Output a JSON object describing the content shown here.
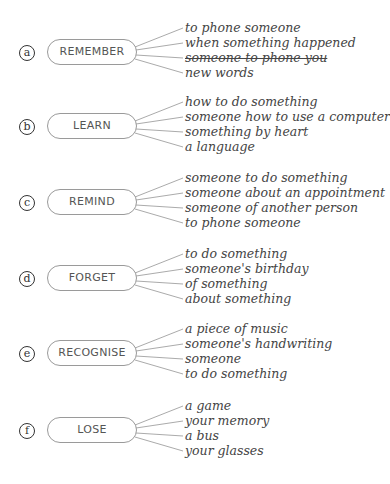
{
  "groups": [
    {
      "letter": "a",
      "verb": "REMEMBER",
      "options": [
        "to phone someone",
        "when something happened",
        "someone to phone you",
        "new words"
      ],
      "struck_index": 2
    },
    {
      "letter": "b",
      "verb": "LEARN",
      "options": [
        "how to do something",
        "someone how to use a computer",
        "something by heart",
        "a language"
      ],
      "struck_index": -1
    },
    {
      "letter": "c",
      "verb": "REMIND",
      "options": [
        "someone to do something",
        "someone about an appointment",
        "someone of another person",
        "to phone someone"
      ],
      "struck_index": -1
    },
    {
      "letter": "d",
      "verb": "FORGET",
      "options": [
        "to do something",
        "someone's birthday",
        "of something",
        "about something"
      ],
      "struck_index": -1
    },
    {
      "letter": "e",
      "verb": "RECOGNISE",
      "options": [
        "a piece of music",
        "someone's handwriting",
        "someone",
        "to do something"
      ],
      "struck_index": -1
    },
    {
      "letter": "f",
      "verb": "LOSE",
      "options": [
        "a game",
        "your memory",
        "a bus",
        "your glasses"
      ],
      "struck_index": -1
    }
  ]
}
